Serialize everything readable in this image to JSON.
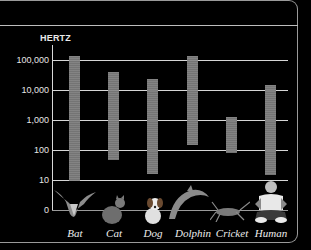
{
  "chart_data": {
    "type": "bar",
    "subtype": "floating-range-bar",
    "title": "",
    "ylabel": "HERTZ",
    "xlabel": "",
    "yscale": "log",
    "yticks": [
      "100,000",
      "10,000",
      "1,000",
      "100",
      "10",
      "0"
    ],
    "ylim": [
      0,
      100000
    ],
    "grid": true,
    "legend": null,
    "categories": [
      "Bat",
      "Cat",
      "Dog",
      "Dolphin",
      "Cricket",
      "Human"
    ],
    "series": [
      {
        "name": "Lowest audible frequency (Hz)",
        "values": [
          10,
          45,
          15,
          150,
          100,
          20
        ]
      },
      {
        "name": "Highest audible frequency (Hz)",
        "values": [
          150000,
          40000,
          25000,
          150000,
          1200,
          20000
        ]
      }
    ],
    "annotations": [
      "Animal photos below each category: bat, cat, dog, dolphin, cricket, human"
    ]
  },
  "axis": {
    "title": "HERTZ",
    "ticks": [
      {
        "label": "100,000",
        "y": 60
      },
      {
        "label": "10,000",
        "y": 90
      },
      {
        "label": "1,000",
        "y": 120
      },
      {
        "label": "100",
        "y": 150
      },
      {
        "label": "10",
        "y": 180
      },
      {
        "label": "0",
        "y": 210
      }
    ]
  },
  "bars": [
    {
      "name": "Bat",
      "x": 69,
      "top": 56,
      "bottom": 181
    },
    {
      "name": "Cat",
      "x": 108,
      "top": 72,
      "bottom": 160
    },
    {
      "name": "Dog",
      "x": 147,
      "top": 79,
      "bottom": 174
    },
    {
      "name": "Dolphin",
      "x": 187,
      "top": 56,
      "bottom": 145
    },
    {
      "name": "Cricket",
      "x": 226,
      "top": 117,
      "bottom": 153
    },
    {
      "name": "Human",
      "x": 265,
      "top": 85,
      "bottom": 175
    }
  ],
  "labels": [
    "Bat",
    "Cat",
    "Dog",
    "Dolphin",
    "Cricket",
    "Human"
  ],
  "colors": {
    "background": "#000000",
    "bar": "#858585",
    "grid": "#d6d6d6",
    "text": "#eeeeee"
  }
}
